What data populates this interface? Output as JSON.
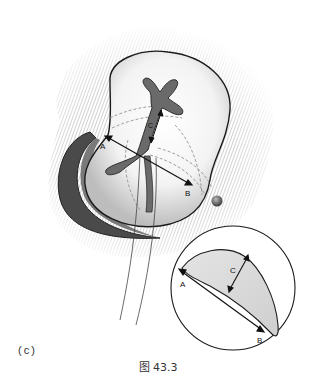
{
  "figure": {
    "caption": "图 43.3",
    "panel_label": "(c)",
    "main_view": {
      "labels": {
        "a": "A",
        "b": "B",
        "c": "C"
      }
    },
    "inset": {
      "labels": {
        "a": "A",
        "b": "B",
        "c": "C"
      }
    }
  }
}
